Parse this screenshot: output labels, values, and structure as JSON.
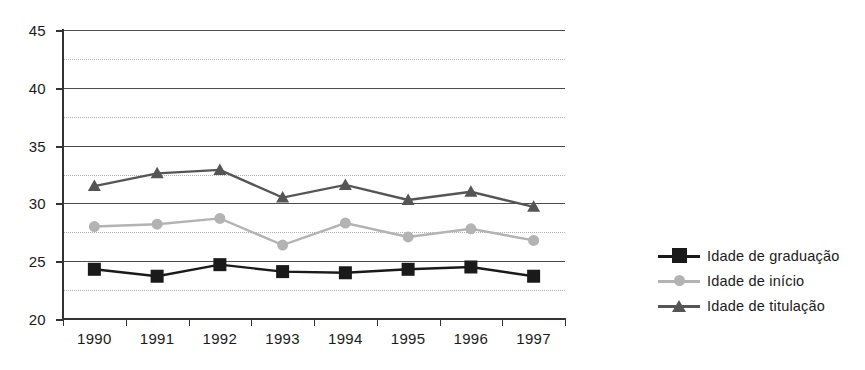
{
  "chart_data": {
    "type": "line",
    "title": "",
    "subtitle": "",
    "xlabel": "",
    "ylabel": "",
    "categories": [
      "1990",
      "1991",
      "1992",
      "1993",
      "1994",
      "1995",
      "1996",
      "1997"
    ],
    "series": [
      {
        "name": "Idade de graduação",
        "color": "#1a1a1a",
        "marker": "square",
        "values": [
          24.3,
          23.7,
          24.7,
          24.1,
          24.0,
          24.3,
          24.5,
          23.7
        ]
      },
      {
        "name": "Idade  de início",
        "color": "#b3b3b3",
        "marker": "circle",
        "values": [
          28.0,
          28.2,
          28.7,
          26.4,
          28.3,
          27.1,
          27.8,
          26.8
        ]
      },
      {
        "name": "Idade  de titulação",
        "color": "#555555",
        "marker": "triangle",
        "values": [
          31.5,
          32.6,
          32.9,
          30.5,
          31.6,
          30.3,
          31.0,
          29.7
        ]
      }
    ],
    "ylim": [
      20,
      45
    ],
    "y_ticks": [
      20,
      25,
      30,
      35,
      40,
      45
    ],
    "y_tick_labels": [
      "20",
      "25",
      "30",
      "35",
      "40",
      "45"
    ],
    "y_minor_gridlines": [
      22.5,
      27.5,
      32.5,
      37.5,
      42.5
    ],
    "grid": true,
    "legend_position": "right",
    "colors": {
      "axis": "#333333",
      "major_gridline": "#4d4d4d",
      "minor_gridline": "#b0b0b0",
      "background": "#ffffff",
      "text": "#1a1a1a"
    }
  },
  "legend": {
    "items": [
      {
        "label": "Idade de graduação"
      },
      {
        "label": "Idade  de início"
      },
      {
        "label": "Idade  de titulação"
      }
    ]
  }
}
